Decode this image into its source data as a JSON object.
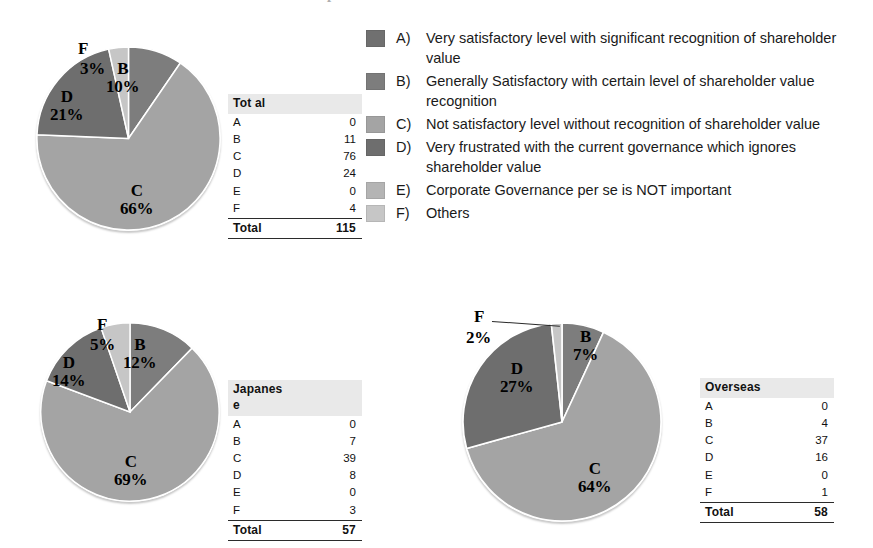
{
  "figure": {
    "title": "C. Evaluation of Japanese investors"
  },
  "legend": {
    "items": [
      {
        "key": "A)",
        "text": "Very satisfactory level with significant recognition of shareholder value",
        "color": "#707070",
        "swatch_name": "legend-swatch-a"
      },
      {
        "key": "B)",
        "text": "Generally Satisfactory with certain level of shareholder value recognition",
        "color": "#7d7d7d",
        "swatch_name": "legend-swatch-b"
      },
      {
        "key": "C)",
        "text": "Not satisfactory level without recognition of shareholder value",
        "color": "#a4a4a4",
        "swatch_name": "legend-swatch-c"
      },
      {
        "key": "D)",
        "text": "Very frustrated with the current governance which ignores shareholder value",
        "color": "#6e6e6e",
        "swatch_name": "legend-swatch-d"
      },
      {
        "key": "E)",
        "text": "Corporate Governance per se is NOT important",
        "color": "#b4b4b4",
        "swatch_name": "legend-swatch-e"
      },
      {
        "key": "F)",
        "text": "Others",
        "color": "#c6c6c6",
        "swatch_name": "legend-swatch-f"
      }
    ]
  },
  "chart_data": [
    {
      "type": "pie",
      "title": "Total",
      "categories": [
        "A",
        "B",
        "C",
        "D",
        "E",
        "F"
      ],
      "values": [
        0,
        11,
        76,
        24,
        0,
        4
      ],
      "percent_labels": [
        "",
        "10%",
        "66%",
        "21%",
        "",
        "3%"
      ],
      "colors": [
        "#707070",
        "#7d7d7d",
        "#a4a4a4",
        "#6e6e6e",
        "#b4b4b4",
        "#c6c6c6"
      ],
      "total_label": "Total",
      "total_value": 115,
      "header": "Tot al"
    },
    {
      "type": "pie",
      "title": "Japanese",
      "categories": [
        "A",
        "B",
        "C",
        "D",
        "E",
        "F"
      ],
      "values": [
        0,
        7,
        39,
        8,
        0,
        3
      ],
      "percent_labels": [
        "",
        "12%",
        "69%",
        "14%",
        "",
        "5%"
      ],
      "colors": [
        "#707070",
        "#7d7d7d",
        "#a4a4a4",
        "#6e6e6e",
        "#b4b4b4",
        "#c6c6c6"
      ],
      "total_label": "Total",
      "total_value": 57,
      "header": "Japanes e"
    },
    {
      "type": "pie",
      "title": "Overseas",
      "categories": [
        "A",
        "B",
        "C",
        "D",
        "E",
        "F"
      ],
      "values": [
        0,
        4,
        37,
        16,
        0,
        1
      ],
      "percent_labels": [
        "",
        "7%",
        "64%",
        "27%",
        "",
        "2%"
      ],
      "colors": [
        "#707070",
        "#7d7d7d",
        "#a4a4a4",
        "#6e6e6e",
        "#b4b4b4",
        "#c6c6c6"
      ],
      "total_label": "Total",
      "total_value": 58,
      "header": "Overseas"
    }
  ],
  "pies": {
    "total": {
      "labels": {
        "b": {
          "letter": "B",
          "pct": "10%"
        },
        "c": {
          "letter": "C",
          "pct": "66%"
        },
        "d": {
          "letter": "D",
          "pct": "21%"
        },
        "f_letter": "F",
        "f_pct": "3%"
      }
    },
    "japanese": {
      "labels": {
        "b": {
          "letter": "B",
          "pct": "12%"
        },
        "c": {
          "letter": "C",
          "pct": "69%"
        },
        "d": {
          "letter": "D",
          "pct": "14%"
        },
        "f_letter": "F",
        "f_pct": "5%"
      }
    },
    "overseas": {
      "labels": {
        "b": {
          "letter": "B",
          "pct": "7%"
        },
        "c": {
          "letter": "C",
          "pct": "64%"
        },
        "d": {
          "letter": "D",
          "pct": "27%"
        },
        "f_letter": "F",
        "f_pct": "2%"
      }
    }
  },
  "tables": {
    "total": {
      "header": "Tot al",
      "rows": [
        {
          "k": "A",
          "v": "0"
        },
        {
          "k": "B",
          "v": "11"
        },
        {
          "k": "C",
          "v": "76"
        },
        {
          "k": "D",
          "v": "24"
        },
        {
          "k": "E",
          "v": "0"
        },
        {
          "k": "F",
          "v": "4"
        }
      ],
      "total_label": "Total",
      "total_value": "115"
    },
    "japanese": {
      "header": "Japanes e",
      "rows": [
        {
          "k": "A",
          "v": "0"
        },
        {
          "k": "B",
          "v": "7"
        },
        {
          "k": "C",
          "v": "39"
        },
        {
          "k": "D",
          "v": "8"
        },
        {
          "k": "E",
          "v": "0"
        },
        {
          "k": "F",
          "v": "3"
        }
      ],
      "total_label": "Total",
      "total_value": "57"
    },
    "overseas": {
      "header": "Overseas",
      "rows": [
        {
          "k": "A",
          "v": "0"
        },
        {
          "k": "B",
          "v": "4"
        },
        {
          "k": "C",
          "v": "37"
        },
        {
          "k": "D",
          "v": "16"
        },
        {
          "k": "E",
          "v": "0"
        },
        {
          "k": "F",
          "v": "1"
        }
      ],
      "total_label": "Total",
      "total_value": "58"
    }
  }
}
